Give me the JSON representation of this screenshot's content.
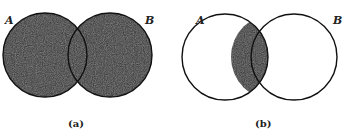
{
  "figure": {
    "colors": {
      "shade": "#2e2e2e",
      "stroke": "#111111",
      "background": "#ffffff"
    },
    "panels": [
      {
        "caption": "(a)",
        "set_labels": [
          "A",
          "B"
        ],
        "shaded_region": "union",
        "meaning": "A ∪ B"
      },
      {
        "caption": "(b)",
        "set_labels": [
          "A",
          "B"
        ],
        "shaded_region": "intersection",
        "meaning": "A ∩ B"
      }
    ]
  }
}
